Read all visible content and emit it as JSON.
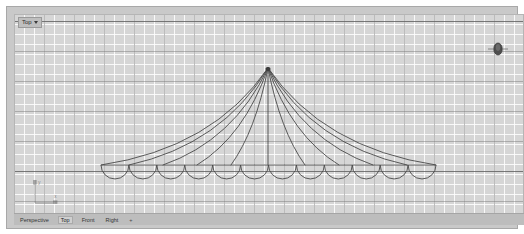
{
  "app": {
    "viewport_label": "Top",
    "viewport_caret_icon": "chevron-down-icon"
  },
  "nav_widget": {
    "icon": "view-navigator-icon"
  },
  "axis_gizmo": {
    "y_label": "y",
    "x_label": "x"
  },
  "tabbar": {
    "tabs": [
      {
        "label": "Perspective",
        "active": false
      },
      {
        "label": "Top",
        "active": true
      },
      {
        "label": "Front",
        "active": false
      },
      {
        "label": "Right",
        "active": false
      },
      {
        "label": "+",
        "active": false
      }
    ]
  },
  "colors": {
    "viewport_background": "#d6d6d6",
    "frame_background": "#c9c9c9",
    "grid_minor": "#ffffff",
    "grid_major": "#787878",
    "grid_axis": "#5f5f5f",
    "curve_stroke": "#4a4a4a",
    "tabbar_background": "#bdbdbd",
    "page_background": "#ffffff"
  },
  "geometry": {
    "description": "circus-tent-wireframe",
    "apex": {
      "x": 253,
      "y": 53
    },
    "baseline_y": 150,
    "base_left_x": 86,
    "base_right_x": 421,
    "scallop_count": 12,
    "scallop_radius": 14,
    "rib_count": 11,
    "ribs": [
      {
        "end_x": 86,
        "bow": 52
      },
      {
        "end_x": 114,
        "bow": 43
      },
      {
        "end_x": 148,
        "bow": 33
      },
      {
        "end_x": 182,
        "bow": 22
      },
      {
        "end_x": 216,
        "bow": 11
      },
      {
        "end_x": 253,
        "bow": 0
      },
      {
        "end_x": 290,
        "bow": -11
      },
      {
        "end_x": 324,
        "bow": -22
      },
      {
        "end_x": 358,
        "bow": -33
      },
      {
        "end_x": 392,
        "bow": -43
      },
      {
        "end_x": 421,
        "bow": -52
      }
    ]
  }
}
